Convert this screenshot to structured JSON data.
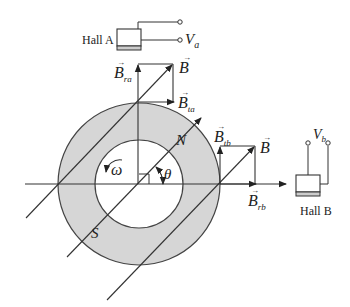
{
  "diagram": {
    "type": "hall-sensor-rotor-field-decomposition",
    "sensors": {
      "hall_a": {
        "label": "Hall A",
        "output": "V",
        "output_sub": "a"
      },
      "hall_b": {
        "label": "Hall B",
        "output": "V",
        "output_sub": "b"
      }
    },
    "vectors": {
      "b": "B",
      "b_ra": {
        "base": "B",
        "sub": "ra"
      },
      "b_ta": {
        "base": "B",
        "sub": "ta"
      },
      "b_tb": {
        "base": "B",
        "sub": "tb"
      },
      "b_rb": {
        "base": "B",
        "sub": "rb"
      }
    },
    "rotor": {
      "north": "N",
      "south": "S",
      "angular_velocity": "ω",
      "angle": "θ"
    },
    "colors": {
      "ring_fill": "#d6d6d6",
      "stroke": "#333333",
      "background": "#ffffff"
    }
  }
}
